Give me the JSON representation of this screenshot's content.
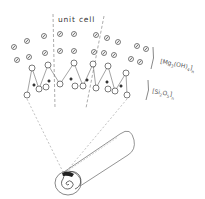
{
  "labels": {
    "unit_cell": "unit cell",
    "octahedral_layer": "[Mg3(OH)4]n",
    "octahedral_main": "[Mg",
    "octahedral_sub1": "3",
    "octahedral_mid": "(OH)",
    "octahedral_sub2": "4",
    "octahedral_end": "]",
    "octahedral_n": "n",
    "tetrahedral_layer": "[Si2O5]n",
    "tetrahedral_main": "[Si",
    "tetrahedral_sub1": "2",
    "tetrahedral_mid": "O",
    "tetrahedral_sub2": "5",
    "tetrahedral_end": "]",
    "tetrahedral_n": "n"
  },
  "colors": {
    "line": "#555555",
    "dash": "#888888",
    "fill_dark": "#222222",
    "background": "#ffffff"
  },
  "atoms": {
    "hydroxyl_top": [
      [
        14,
        47
      ],
      [
        27,
        41
      ],
      [
        44,
        36
      ],
      [
        60,
        34
      ],
      [
        74,
        34
      ],
      [
        96,
        35
      ],
      [
        107,
        38
      ],
      [
        118,
        42
      ],
      [
        137,
        46
      ],
      [
        146,
        49
      ]
    ],
    "hydroxyl_mid": [
      [
        17,
        60
      ],
      [
        29,
        57
      ],
      [
        45,
        53
      ],
      [
        60,
        51
      ],
      [
        74,
        51
      ],
      [
        94,
        52
      ],
      [
        104,
        53
      ],
      [
        114,
        55
      ],
      [
        131,
        59
      ],
      [
        140,
        62
      ]
    ],
    "oxygen_apical": [
      [
        21,
        71
      ],
      [
        32,
        68
      ],
      [
        48,
        65
      ],
      [
        60,
        63
      ],
      [
        74,
        63
      ],
      [
        93,
        64
      ],
      [
        103,
        66
      ],
      [
        126,
        73
      ],
      [
        134,
        76
      ]
    ],
    "oxygen_chain_top": [
      [
        32,
        68
      ],
      [
        48,
        65
      ],
      [
        74,
        63
      ],
      [
        93,
        64
      ],
      [
        108,
        66
      ],
      [
        126,
        73
      ]
    ],
    "oxygen_bottom": [
      [
        27,
        95
      ],
      [
        39,
        89
      ],
      [
        46,
        87
      ],
      [
        60,
        84
      ],
      [
        75,
        86
      ],
      [
        83,
        86
      ],
      [
        96,
        88
      ],
      [
        108,
        89
      ],
      [
        115,
        91
      ],
      [
        127,
        95
      ]
    ],
    "silicon": [
      [
        34,
        85
      ],
      [
        49,
        81
      ],
      [
        71,
        79
      ],
      [
        87,
        80
      ],
      [
        107,
        82
      ],
      [
        121,
        86
      ]
    ]
  },
  "chain_path": [
    [
      27,
      95
    ],
    [
      32,
      68
    ],
    [
      39,
      89
    ],
    [
      48,
      65
    ],
    [
      60,
      84
    ],
    [
      74,
      63
    ],
    [
      83,
      86
    ],
    [
      93,
      64
    ],
    [
      96,
      88
    ],
    [
      108,
      66
    ],
    [
      115,
      91
    ],
    [
      126,
      73
    ],
    [
      127,
      95
    ]
  ],
  "nanotube": {
    "description": "rolled chrysotile fiber with spiral cross-section"
  }
}
